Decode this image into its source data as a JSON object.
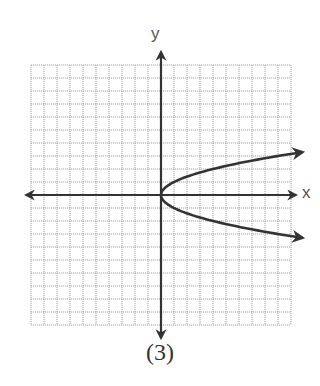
{
  "figure": {
    "caption": "(3)",
    "x_axis_label": "x",
    "y_axis_label": "y"
  },
  "chart_data": {
    "type": "line",
    "title": "",
    "caption": "(3)",
    "xlabel": "x",
    "ylabel": "y",
    "grid": true,
    "grid_cells": {
      "columns": 20,
      "rows": 20
    },
    "xlim": [
      -10,
      10
    ],
    "ylim": [
      -10,
      10
    ],
    "tick_labels": false,
    "series": [
      {
        "name": "sideways parabola (estimated from sampled points, not labeled in image)",
        "equation_estimate": "x = y^2",
        "vertex": [
          0,
          0
        ],
        "opens": "right",
        "points": [
          [
            10.9,
            3.3
          ],
          [
            9,
            3
          ],
          [
            4,
            2
          ],
          [
            1,
            1
          ],
          [
            0,
            0
          ],
          [
            1,
            -1
          ],
          [
            4,
            -2
          ],
          [
            9,
            -3
          ],
          [
            10.9,
            -3.3
          ]
        ],
        "arrows_at_ends": true
      }
    ],
    "axes_arrows": true
  },
  "colors": {
    "grid": "#9a9a9a",
    "axis": "#333333",
    "curve": "#333333",
    "background": "#ffffff"
  }
}
